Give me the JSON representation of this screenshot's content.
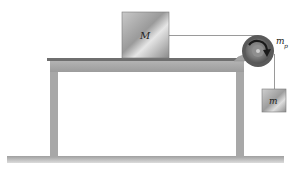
{
  "diagram": {
    "type": "physics-pulley-system",
    "labels": {
      "block_on_table": "M",
      "pulley": "m",
      "pulley_subscript": "p",
      "hanging_block": "m"
    },
    "colors": {
      "background": "#ffffff",
      "table": "#a9a9a9",
      "table_edge": "#6f6f6f",
      "block_light": "#d8d8d8",
      "block_dark": "#8c8c8c",
      "pulley_outer": "#555555",
      "pulley_inner": "#8a8a8a",
      "string": "#9a9a9a",
      "ground": "#b5b5b5",
      "arrow": "#1a1a1a"
    }
  }
}
